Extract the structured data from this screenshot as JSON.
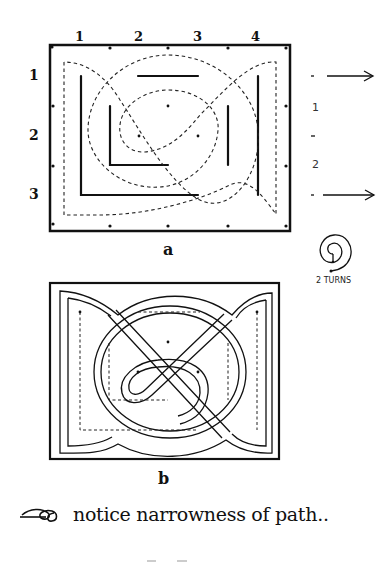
{
  "diagram_a": {
    "caption": "a",
    "column_labels": [
      "1",
      "2",
      "3",
      "4"
    ],
    "row_labels": [
      "1",
      "2",
      "3"
    ],
    "side_labels": [
      "1",
      "–",
      "2"
    ]
  },
  "spiral_note": {
    "label": "2 TURNS"
  },
  "diagram_b": {
    "caption": "b"
  },
  "note": {
    "text": "notice narrowness of path.."
  }
}
